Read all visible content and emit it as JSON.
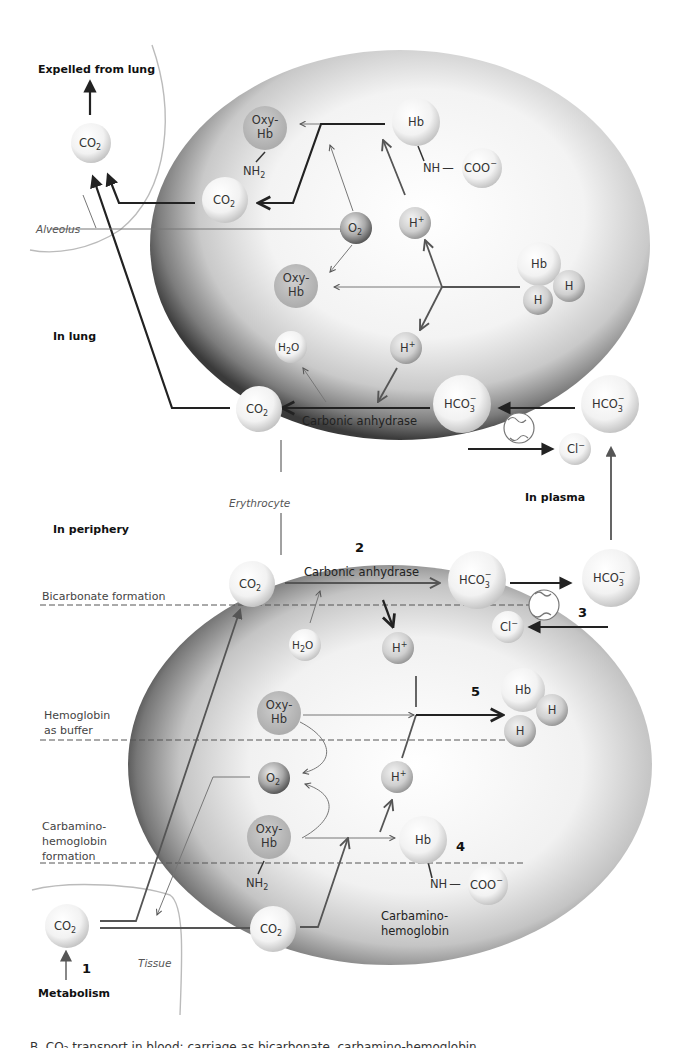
{
  "regions": {
    "expelled": "Expelled from lung",
    "alveolus": "Alveolus",
    "in_lung": "In lung",
    "erythrocyte": "Erythrocyte",
    "in_plasma": "In plasma",
    "in_periphery": "In periphery",
    "tissue": "Tissue",
    "metabolism": "Metabolism"
  },
  "zones": {
    "bicarbonate": "Bicarbonate formation",
    "hb_buffer_1": "Hemoglobin",
    "hb_buffer_2": "as buffer",
    "carbamino_1": "Carbamino-",
    "carbamino_2": "hemoglobin",
    "carbamino_3": "formation"
  },
  "enzymes": {
    "lung": "Carbonic anhydrase",
    "periphery": "Carbonic anhydrase"
  },
  "steps": {
    "s1": "1",
    "s2": "2",
    "s3": "3",
    "s4": "4",
    "s5": "5"
  },
  "molecules": {
    "co2": {
      "base": "CO",
      "sub": "2"
    },
    "h2o": {
      "pre": "H",
      "sub": "2",
      "post": "O"
    },
    "o2": {
      "base": "O",
      "sub": "2"
    },
    "hplus": {
      "base": "H",
      "sup": "+"
    },
    "hco3": {
      "base": "HCO",
      "sub": "3",
      "sup": "−"
    },
    "cl": {
      "base": "Cl",
      "sup": "−"
    },
    "hb": "Hb",
    "h": "H",
    "oxy_1": "Oxy-",
    "oxy_2": "Hb",
    "nh2": {
      "base": "NH",
      "sub": "2"
    },
    "nh": "NH",
    "dash": "—",
    "coo": {
      "base": "COO",
      "sup": "−"
    },
    "carbamino_1": "Carbamino-",
    "carbamino_2": "hemoglobin"
  },
  "caption_cut": "B. CO₂ transport in blood: carriage as bicarbonate, carbamino-hemoglobin"
}
